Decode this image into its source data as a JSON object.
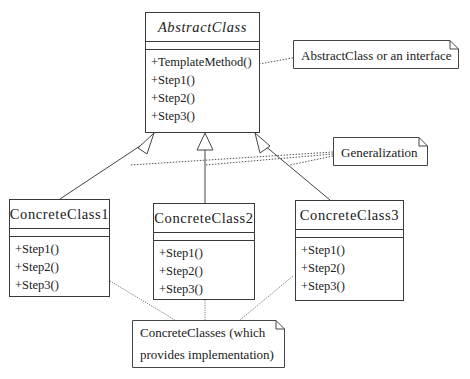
{
  "abstract_class": {
    "name": "AbstractClass",
    "operations": [
      "+TemplateMethod()",
      "+Step1()",
      "+Step2()",
      "+Step3()"
    ]
  },
  "concrete_classes": [
    {
      "name": "ConcreteClass1",
      "operations": [
        "+Step1()",
        "+Step2()",
        "+Step3()"
      ]
    },
    {
      "name": "ConcreteClass2",
      "operations": [
        "+Step1()",
        "+Step2()",
        "+Step3()"
      ]
    },
    {
      "name": "ConcreteClass3",
      "operations": [
        "+Step1()",
        "+Step2()",
        "+Step3()"
      ]
    }
  ],
  "notes": {
    "abstract": "AbstractClass or an interface",
    "generalization": "Generalization",
    "concrete_line1": "ConcreteClasses (which",
    "concrete_line2": "provides implementation)"
  },
  "colors": {
    "line": "#3a3a3a",
    "background": "#ffffff"
  }
}
